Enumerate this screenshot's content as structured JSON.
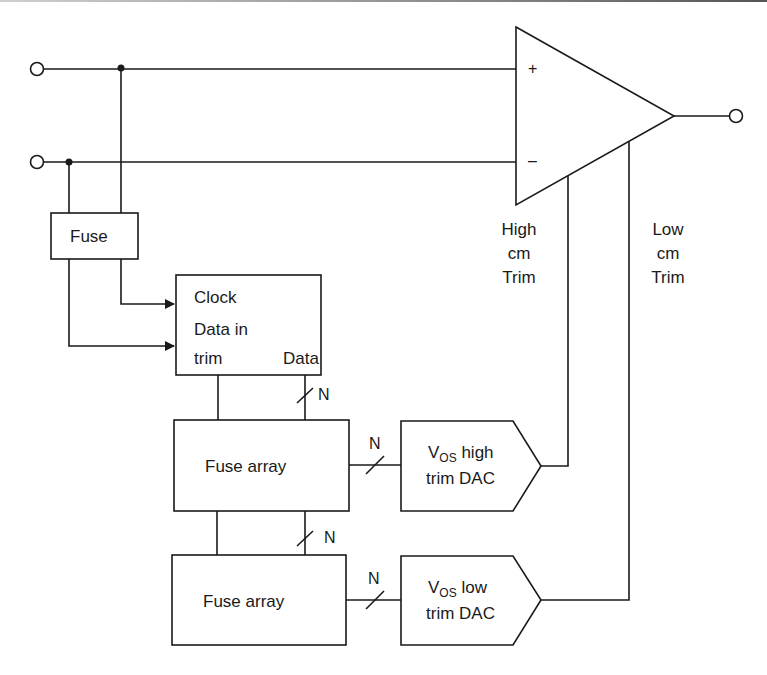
{
  "diagram": {
    "type": "op-amp offset trim circuit block diagram",
    "colors": {
      "stroke": "#1a1a1a",
      "background": "#ffffff"
    },
    "opamp": {
      "plus_label": "+",
      "minus_label": "–",
      "high_trim_label": [
        "High",
        "cm",
        "Trim"
      ],
      "low_trim_label": [
        "Low",
        "cm",
        "Trim"
      ]
    },
    "fuse_block": {
      "label": "Fuse"
    },
    "control_block": {
      "clock_label": "Clock",
      "data_in_label": "Data in",
      "trim_label": "trim",
      "data_label": "Data"
    },
    "fuse_array_1": {
      "label": "Fuse array"
    },
    "fuse_array_2": {
      "label": "Fuse array"
    },
    "dac_high": {
      "v_label": "V",
      "sub_label": "OS",
      "line1_rest": " high",
      "line2": "trim DAC"
    },
    "dac_low": {
      "v_label": "V",
      "sub_label": "OS",
      "line1_rest": " low",
      "line2": "trim DAC"
    },
    "bus_width_label": "N",
    "buses": [
      {
        "name": "control-to-fuse-array-1",
        "label": "N"
      },
      {
        "name": "fuse-array-1-to-fuse-array-2",
        "label": "N"
      },
      {
        "name": "fuse-array-1-to-dac-high",
        "label": "N"
      },
      {
        "name": "fuse-array-2-to-dac-low",
        "label": "N"
      }
    ]
  }
}
